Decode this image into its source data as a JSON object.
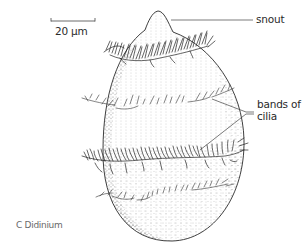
{
  "figure": {
    "caption": "C Didinium",
    "scale_bar": {
      "label": "20 µm"
    },
    "labels": {
      "snout": "snout",
      "cilia_line1": "bands of",
      "cilia_line2": "cilia"
    },
    "colors": {
      "ink": "#2a2a2a",
      "stipple": "#555555",
      "caption": "#6a6a6a",
      "background": "#ffffff"
    }
  }
}
